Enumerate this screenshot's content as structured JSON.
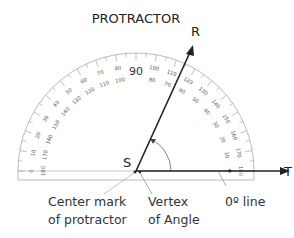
{
  "title": "PROTRACTOR",
  "points": {
    "vertex": "S",
    "ray_end": "R",
    "base_end": "T"
  },
  "callouts": {
    "center_mark": {
      "line1": "Center mark",
      "line2": "of protractor"
    },
    "vertex": {
      "line1": "Vertex",
      "line2": "of Angle"
    },
    "zero_line": {
      "line1": "0º line"
    }
  },
  "scale": {
    "outer_labels": [
      "0",
      "10",
      "20",
      "30",
      "40",
      "50",
      "60",
      "70",
      "80",
      "90",
      "100",
      "110",
      "120",
      "130",
      "140",
      "150",
      "160",
      "170",
      "180"
    ],
    "inner_labels": [
      "180",
      "170",
      "160",
      "150",
      "140",
      "130",
      "120",
      "110",
      "100",
      "90",
      "80",
      "70",
      "60",
      "50",
      "40",
      "30",
      "20",
      "10",
      "0"
    ],
    "center_label": "90"
  },
  "colors": {
    "protractor_outline": "#aaaaaa",
    "ray": "#222222",
    "text": "#333333"
  }
}
